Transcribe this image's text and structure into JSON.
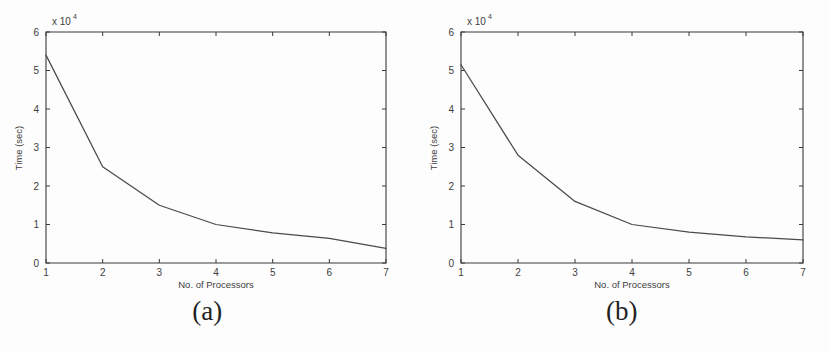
{
  "figure": {
    "panels": [
      {
        "caption": "(a)",
        "axes": {
          "xlabel": "No. of Processors",
          "ylabel": "Time (sec)",
          "exponent_prefix": "x 10",
          "exponent_power": "4",
          "xticks": [
            "1",
            "2",
            "3",
            "4",
            "5",
            "6",
            "7"
          ],
          "yticks": [
            "0",
            "1",
            "2",
            "3",
            "4",
            "5",
            "6"
          ]
        }
      },
      {
        "caption": "(b)",
        "axes": {
          "xlabel": "No. of Processors",
          "ylabel": "Time (sec)",
          "exponent_prefix": "x 10",
          "exponent_power": "4",
          "xticks": [
            "1",
            "2",
            "3",
            "4",
            "5",
            "6",
            "7"
          ],
          "yticks": [
            "0",
            "1",
            "2",
            "3",
            "4",
            "5",
            "6"
          ]
        }
      }
    ]
  },
  "chart_data": [
    {
      "type": "line",
      "title": "(a)",
      "xlabel": "No. of Processors",
      "ylabel": "Time (sec)",
      "y_exponent": 10000,
      "y_exponent_label": "x 10^4",
      "xlim": [
        1,
        7
      ],
      "ylim": [
        0,
        6
      ],
      "xticks": [
        1,
        2,
        3,
        4,
        5,
        6,
        7
      ],
      "yticks": [
        0,
        1,
        2,
        3,
        4,
        5,
        6
      ],
      "grid": false,
      "legend": "none",
      "x": [
        1,
        2,
        3,
        4,
        5,
        6,
        7
      ],
      "values": [
        5.4,
        2.5,
        1.5,
        1.0,
        0.78,
        0.64,
        0.38
      ],
      "values_absolute": [
        54000,
        25000,
        15000,
        10000,
        7800,
        6400,
        3800
      ]
    },
    {
      "type": "line",
      "title": "(b)",
      "xlabel": "No. of Processors",
      "ylabel": "Time (sec)",
      "y_exponent": 10000,
      "y_exponent_label": "x 10^4",
      "xlim": [
        1,
        7
      ],
      "ylim": [
        0,
        6
      ],
      "xticks": [
        1,
        2,
        3,
        4,
        5,
        6,
        7
      ],
      "yticks": [
        0,
        1,
        2,
        3,
        4,
        5,
        6
      ],
      "grid": false,
      "legend": "none",
      "x": [
        1,
        2,
        3,
        4,
        5,
        6,
        7
      ],
      "values": [
        5.15,
        2.8,
        1.6,
        1.0,
        0.8,
        0.68,
        0.6
      ],
      "values_absolute": [
        51500,
        28000,
        16000,
        10000,
        8000,
        6800,
        6000
      ]
    }
  ]
}
